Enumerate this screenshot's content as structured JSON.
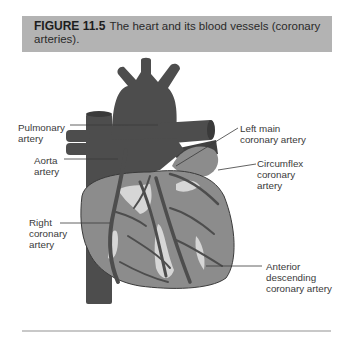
{
  "caption": {
    "label": "FIGURE 11.5",
    "text": "The heart and its blood vessels (coronary arteries)."
  },
  "labels": {
    "pulmonary_artery": [
      "Pulmonary",
      "artery"
    ],
    "aorta_artery": [
      "Aorta",
      "artery"
    ],
    "right_coronary_artery": [
      "Right",
      "coronary",
      "artery"
    ],
    "left_main_coronary_artery": [
      "Left main",
      "coronary artery"
    ],
    "circumflex_coronary_artery": [
      "Circumflex",
      "coronary",
      "artery"
    ],
    "anterior_descending_coronary_artery": [
      "Anterior",
      "descending",
      "coronary artery"
    ]
  },
  "colors": {
    "caption_bg": "#b3b3b3",
    "vessel_dark": "#4d4d4d",
    "muscle_mid": "#8c8c8c",
    "highlight_light": "#d6d6d6",
    "rule": "#c8c8c8"
  }
}
